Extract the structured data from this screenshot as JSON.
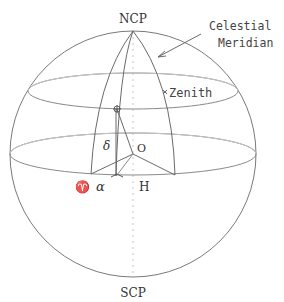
{
  "diagram": {
    "labels": {
      "north_pole": "NCP",
      "south_pole": "SCP",
      "zenith": "Zenith",
      "meridian_line1": "Celestial",
      "meridian_line2": "Meridian",
      "declination": "δ",
      "origin": "O",
      "right_ascension": "α",
      "hour_angle": "H",
      "vernal_equinox": "♈"
    },
    "colors": {
      "line": "#6a6a6a",
      "faint_line": "#b8b8b8",
      "text": "#333333"
    }
  }
}
